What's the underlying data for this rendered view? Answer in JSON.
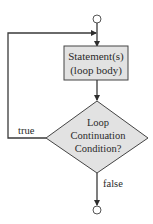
{
  "diagram": {
    "type": "flowchart",
    "nodes": {
      "start": {
        "shape": "circle"
      },
      "body": {
        "shape": "rectangle",
        "line1": "Statement(s)",
        "line2": "(loop body)",
        "fill": "#e2e2e2"
      },
      "condition": {
        "shape": "diamond",
        "line1": "Loop",
        "line2": "Continuation",
        "line3": "Condition?",
        "fill": "#e2e2e2"
      },
      "end": {
        "shape": "circle"
      }
    },
    "edges": {
      "true_label": "true",
      "false_label": "false"
    },
    "colors": {
      "stroke": "#3a3a3a",
      "shape_fill": "#e2e2e2",
      "text": "#2a2a2a"
    }
  }
}
